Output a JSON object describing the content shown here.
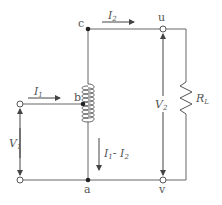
{
  "diagram": {
    "type": "autotransformer-circuit",
    "nodes": {
      "a": "a",
      "b": "b",
      "c": "c",
      "u": "u",
      "v": "v"
    },
    "labels": {
      "I1": {
        "main": "I",
        "sub": "1"
      },
      "I2": {
        "main": "I",
        "sub": "2"
      },
      "I1_minus_I2": {
        "main1": "I",
        "sub1": "1",
        "op": "- ",
        "main2": "I",
        "sub2": "2"
      },
      "V1": {
        "main": "V",
        "sub": "1"
      },
      "V2": {
        "main": "V",
        "sub": "2"
      },
      "RL": {
        "main": "R",
        "sub": "L"
      }
    },
    "colors": {
      "wire": "#555555",
      "text": "#555555",
      "background": "#ffffff"
    }
  }
}
